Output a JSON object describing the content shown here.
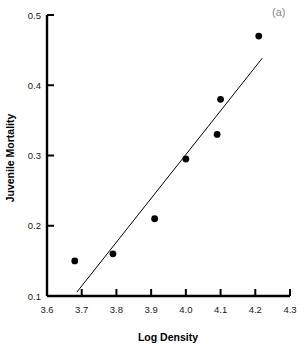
{
  "chart_data": {
    "type": "scatter",
    "title": "",
    "panel_label": "(a)",
    "xlabel": "Log Density",
    "ylabel": "Juvenile Mortality",
    "xlim": [
      3.6,
      4.3
    ],
    "ylim": [
      0.1,
      0.5
    ],
    "xticks": [
      3.6,
      3.7,
      3.8,
      3.9,
      4.0,
      4.1,
      4.2,
      4.3
    ],
    "xtick_labels": [
      "3.6",
      "3.7",
      "3.8",
      "3.9",
      "4.0",
      "4.1",
      "4.2",
      "4.3"
    ],
    "yticks": [
      0.1,
      0.2,
      0.3,
      0.4,
      0.5
    ],
    "ytick_labels": [
      "0.1",
      "0.2",
      "0.3",
      "0.4",
      "0.5"
    ],
    "grid": false,
    "legend": false,
    "marker": "filled-circle",
    "marker_color": "#000000",
    "points": [
      {
        "x": 3.68,
        "y": 0.15
      },
      {
        "x": 3.79,
        "y": 0.16
      },
      {
        "x": 3.91,
        "y": 0.21
      },
      {
        "x": 4.0,
        "y": 0.295
      },
      {
        "x": 4.09,
        "y": 0.33
      },
      {
        "x": 4.1,
        "y": 0.38
      },
      {
        "x": 4.21,
        "y": 0.47
      }
    ],
    "x": [
      3.68,
      3.79,
      3.91,
      4.0,
      4.09,
      4.1,
      4.21
    ],
    "values": [
      0.15,
      0.16,
      0.21,
      0.295,
      0.33,
      0.38,
      0.47
    ],
    "trendline": {
      "type": "line",
      "color": "#000000",
      "x_start": 3.686,
      "y_start": 0.1055,
      "x_end": 4.22,
      "y_end": 0.4385
    }
  },
  "axes": {
    "x_axis_name": "Log Density",
    "y_axis_name": "Juvenile Mortality"
  },
  "annotations": {
    "panel": "(a)"
  },
  "colors": {
    "axis": "#000000",
    "marker": "#000000",
    "trendline": "#000000",
    "panel_label": "#8a8a8a",
    "background": "#ffffff"
  }
}
